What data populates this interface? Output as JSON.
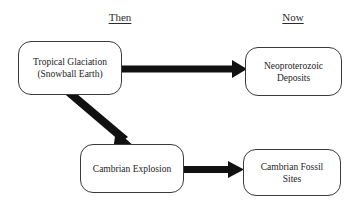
{
  "diagram": {
    "title_then": "Then",
    "title_now": "Now",
    "nodes": [
      {
        "id": "tropical-glaciation",
        "label": "Tropical Glaciation\n(Snowball Earth)"
      },
      {
        "id": "neoproterozoic",
        "label": "Neoproterozoic\nDeposits"
      },
      {
        "id": "cambrian-explosion",
        "label": "Cambrian Explosion"
      },
      {
        "id": "cambrian-fossil",
        "label": "Cambrian Fossil\nSites"
      }
    ],
    "arrows": [
      {
        "id": "arrow-glaciation-to-deposits",
        "from": "tropical-glaciation",
        "to": "neoproterozoic",
        "direction": "right"
      },
      {
        "id": "arrow-glaciation-to-cambrian",
        "from": "tropical-glaciation",
        "to": "cambrian-explosion",
        "direction": "down-right"
      },
      {
        "id": "arrow-cambrian-to-fossils",
        "from": "cambrian-explosion",
        "to": "cambrian-fossil",
        "direction": "right"
      }
    ],
    "colors": {
      "arrow": "#111111",
      "box_border": "#3a3a3a",
      "background": "#ffffff",
      "text": "#1d1d1d"
    }
  }
}
